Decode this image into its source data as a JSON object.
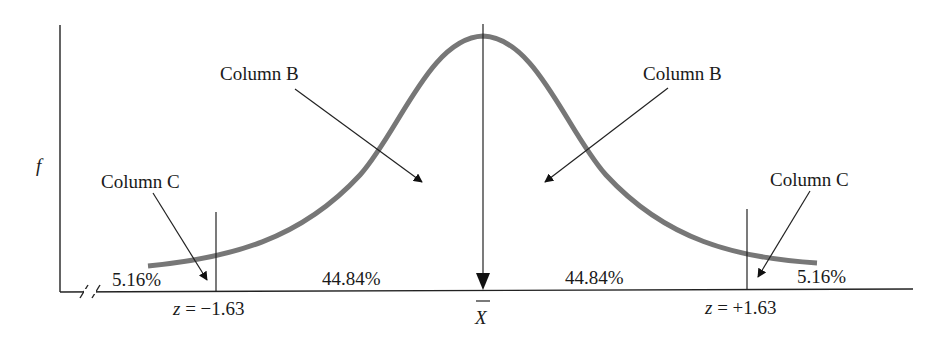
{
  "diagram": {
    "type": "normal-distribution",
    "y_axis_label": "f",
    "center_label": "X",
    "center_label_overbar": true,
    "colors": {
      "curve": "#777777",
      "lines": "#222222",
      "text": "#1a1a1a",
      "background": "#ffffff"
    },
    "callouts": [
      {
        "id": "column-b-left",
        "text": "Column B"
      },
      {
        "id": "column-b-right",
        "text": "Column B"
      },
      {
        "id": "column-c-left",
        "text": "Column C"
      },
      {
        "id": "column-c-right",
        "text": "Column C"
      }
    ],
    "regions": [
      {
        "id": "left-tail",
        "percent": "5.16%"
      },
      {
        "id": "left-middle",
        "percent": "44.84%"
      },
      {
        "id": "right-middle",
        "percent": "44.84%"
      },
      {
        "id": "right-tail",
        "percent": "5.16%"
      }
    ],
    "z_markers": [
      {
        "id": "z-left",
        "var": "z",
        "text": " = −1.63",
        "value": -1.63
      },
      {
        "id": "z-right",
        "var": "z",
        "text": " = +1.63",
        "value": 1.63
      }
    ],
    "axis_break": true
  }
}
